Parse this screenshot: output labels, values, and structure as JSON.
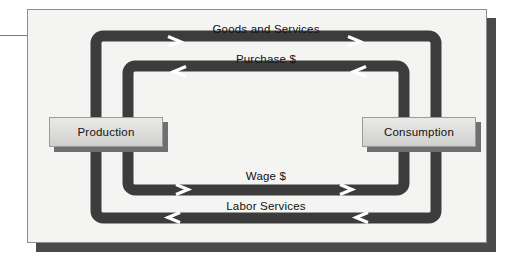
{
  "diagram": {
    "band_color": "#3c3c3c",
    "panel_color": "#f4f4f2",
    "shadow_color": "#4a4a4a",
    "node_fill": "#dcdcda",
    "arrow_notch_color": "#ffffff"
  },
  "nodes": [
    {
      "id": "production",
      "label": "Production"
    },
    {
      "id": "consumption",
      "label": "Consumption"
    }
  ],
  "flows": [
    {
      "id": "goods-and-services",
      "label": "Goods and Services",
      "from": "production",
      "to": "consumption",
      "direction": "right",
      "loop": "outer",
      "side": "top"
    },
    {
      "id": "purchase-dollars",
      "label": "Purchase $",
      "from": "consumption",
      "to": "production",
      "direction": "left",
      "loop": "inner",
      "side": "top"
    },
    {
      "id": "wage-dollars",
      "label": "Wage $",
      "from": "production",
      "to": "consumption",
      "direction": "right",
      "loop": "inner",
      "side": "bottom"
    },
    {
      "id": "labor-services",
      "label": "Labor Services",
      "from": "consumption",
      "to": "production",
      "direction": "left",
      "loop": "outer",
      "side": "bottom"
    }
  ]
}
